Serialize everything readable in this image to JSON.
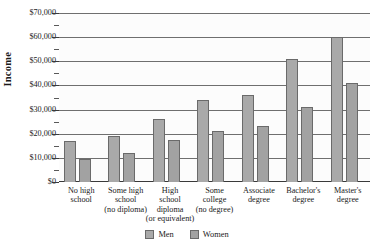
{
  "chart_data": {
    "type": "bar",
    "title": "",
    "xlabel": "",
    "ylabel": "Income",
    "ylim": [
      0,
      70000
    ],
    "ytick_step": 10000,
    "yminor_step": 5000,
    "grid": true,
    "legend_position": "bottom",
    "categories": [
      "No high school school",
      "Some high school (no diploma)",
      "High school diploma (or equivalent)",
      "Some college (no degree)",
      "Associate degree",
      "Bachelor's degree",
      "Master's degree"
    ],
    "category_lines": [
      [
        "No high",
        "school"
      ],
      [
        "Some high",
        "school",
        "(no diploma)"
      ],
      [
        "High",
        "school",
        "diploma",
        "(or equivalent)"
      ],
      [
        "Some",
        "college",
        "(no degree)"
      ],
      [
        "Associate",
        "degree"
      ],
      [
        "Bachelor's",
        "degree"
      ],
      [
        "Master's",
        "degree"
      ]
    ],
    "series": [
      {
        "name": "Men",
        "color": "#a9a9a9",
        "values": [
          17000,
          19000,
          26000,
          34000,
          36000,
          51000,
          60000
        ]
      },
      {
        "name": "Women",
        "color": "#a2a2a2",
        "values": [
          9500,
          12000,
          17500,
          21000,
          23000,
          31000,
          41000
        ]
      }
    ],
    "ytick_labels": [
      "$0",
      "$10,000",
      "$20,000",
      "$30,000",
      "$40,000",
      "$50,000",
      "$60,000",
      "$70,000"
    ],
    "ytick_values": [
      0,
      10000,
      20000,
      30000,
      40000,
      50000,
      60000,
      70000
    ]
  },
  "legend": {
    "items": [
      {
        "label": "Men"
      },
      {
        "label": "Women"
      }
    ]
  }
}
